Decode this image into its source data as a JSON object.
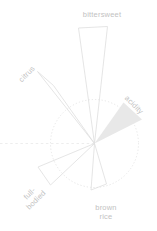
{
  "page": {
    "width": 157,
    "height": 231,
    "background": "#ffffff"
  },
  "colors": {
    "background": "#ffffff",
    "petal_stroke": "#dedede",
    "petal_fill": "#e8e8e8",
    "circle_dotted": "#e4e4e4",
    "axis_dashed": "#e9e9e9",
    "label_text": "#c2c2c2"
  },
  "chart_data": {
    "type": "bar",
    "layout": "polar-petal flavor wheel; thin triangular spikes radiate from a common center; dotted circle is the reference ring (value 1.0); dashed horizontal guide line extends left from center; no numeric axis labels; legend off",
    "title": "",
    "categories": [
      "bittersweet",
      "citrus",
      "acidity",
      "full-bodied",
      "brown rice"
    ],
    "values": [
      2.6,
      1.95,
      1.15,
      1.4,
      1.0
    ],
    "value_unit": "petal length relative to dotted reference circle radius (r 44px = 1.0)",
    "highlighted_category": "acidity",
    "center": {
      "x": 94.5,
      "y": 143.5
    },
    "reference_circle": {
      "cx": 94.5,
      "cy": 143.5,
      "r": 44
    },
    "axis_line": {
      "x1": 0,
      "y1": 143.5,
      "x2": 94,
      "y2": 143.5
    },
    "petals": [
      {
        "label": "bittersweet",
        "angle_deg": 91,
        "value": 2.6,
        "filled": false,
        "points": [
          [
            94.5,
            143.5
          ],
          [
            78.5,
            28
          ],
          [
            107.5,
            26.5
          ]
        ],
        "label_pos": {
          "x": 102,
          "y": 15,
          "rotate": 0,
          "lines": [
            "bittersweet"
          ]
        }
      },
      {
        "label": "citrus",
        "angle_deg": 127,
        "value": 1.95,
        "filled": false,
        "points": [
          [
            94.5,
            143.5
          ],
          [
            37.5,
            71.5
          ],
          [
            53.5,
            85.5
          ]
        ],
        "label_pos": {
          "x": 27,
          "y": 74,
          "rotate": -45,
          "lines": [
            "citrus"
          ]
        }
      },
      {
        "label": "acidity",
        "angle_deg": 37,
        "value": 1.15,
        "filled": true,
        "points": [
          [
            94.5,
            143.5
          ],
          [
            123.5,
            102.5
          ],
          [
            142,
            119.5
          ]
        ],
        "label_pos": {
          "x": 134,
          "y": 105,
          "rotate": 45,
          "lines": [
            "acidity"
          ]
        }
      },
      {
        "label": "full-bodied",
        "angle_deg": 212,
        "value": 1.4,
        "filled": false,
        "points": [
          [
            94.5,
            143.5
          ],
          [
            38,
            167
          ],
          [
            50.5,
            185
          ]
        ],
        "label_pos": {
          "x": 33,
          "y": 197,
          "rotate": -45,
          "lines": [
            "full-",
            "bodied"
          ]
        }
      },
      {
        "label": "brown rice",
        "angle_deg": 275,
        "value": 1.0,
        "filled": false,
        "points": [
          [
            94.5,
            143.5
          ],
          [
            91,
            190
          ],
          [
            106.5,
            184
          ]
        ],
        "label_pos": {
          "x": 106,
          "y": 212,
          "rotate": 0,
          "lines": [
            "brown",
            "rice"
          ]
        }
      }
    ]
  }
}
